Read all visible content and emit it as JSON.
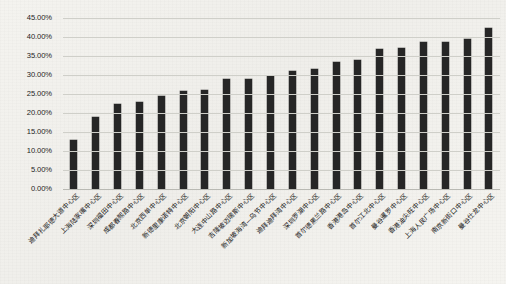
{
  "chart_data": {
    "type": "bar",
    "title": "",
    "subtitle": "",
    "xlabel": "",
    "ylabel": "",
    "ylim": [
      0,
      45
    ],
    "ytick_format": "percent",
    "grid": true,
    "legend": false,
    "legend_position": "none",
    "bar_color": "#262626",
    "gridline_color": "#cfcfc9",
    "background_color": "#f2f1ed",
    "axis_text_color": "#1d1d1d",
    "label_rotation_deg": -45,
    "ytick_labels": [
      "0.00%",
      "5.00%",
      "10.00%",
      "15.00%",
      "20.00%",
      "25.00%",
      "30.00%",
      "35.00%",
      "40.00%",
      "45.00%"
    ],
    "ytick_values": [
      0,
      5,
      10,
      15,
      20,
      25,
      30,
      35,
      40,
      45
    ],
    "categories": [
      "迪拜扎耶德大道中心区",
      "上海陆家嘴中心区",
      "深圳福田中心区",
      "成都春熙路中心区",
      "北京西单中心区",
      "新德里康诺特中心区",
      "北京朝阳中心区",
      "大连中山路中心区",
      "吉隆坡迈瑞斯中心区",
      "新加坡海湾—乌节中心区",
      "迪拜迪拜湾中心区",
      "深圳罗湖中心区",
      "首尔德黑兰路中心区",
      "香港港岛中心区",
      "首尔江北中心区",
      "曼谷暹罗中心区",
      "香港油尖旺中心区",
      "上海人民广场中心区",
      "南京新街口中心区",
      "曼谷仕龙中心区"
    ],
    "values": [
      12.8,
      19.0,
      22.3,
      23.0,
      24.4,
      25.9,
      26.1,
      28.9,
      29.0,
      29.8,
      31.0,
      31.7,
      33.5,
      34.0,
      36.8,
      37.0,
      38.6,
      38.8,
      39.6,
      42.5
    ]
  }
}
